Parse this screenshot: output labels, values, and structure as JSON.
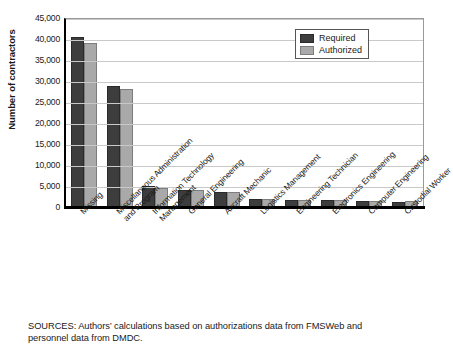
{
  "chart_data": {
    "type": "bar",
    "title": "",
    "xlabel": "",
    "ylabel": "Number of contractors",
    "ylim": [
      0,
      45000
    ],
    "ytick_labels": [
      "45,000",
      "40,000",
      "35,000",
      "30,000",
      "25,000",
      "20,000",
      "15,000",
      "10,000",
      "5,000",
      "0"
    ],
    "ytick_values": [
      45000,
      40000,
      35000,
      30000,
      25000,
      20000,
      15000,
      10000,
      5000,
      0
    ],
    "grid": true,
    "legend_position": "upper right",
    "categories": [
      "Missing",
      "Miscellaneous Administration and Program",
      "Information Technology Management",
      "General Engineering",
      "Aircraft Mechanic",
      "Logistics Management",
      "Engineering Technician",
      "Electronics Engineering",
      "Computer Engineering",
      "Custodial Worker"
    ],
    "category_lines": [
      [
        "Missing"
      ],
      [
        "Miscellaneous Administration",
        "and Program"
      ],
      [
        "Information Technology",
        "Management"
      ],
      [
        "General Engineering"
      ],
      [
        "Aircraft Mechanic"
      ],
      [
        "Logistics Management"
      ],
      [
        "Engineering Technician"
      ],
      [
        "Electronics Engineering"
      ],
      [
        "Computer Engineering"
      ],
      [
        "Custodial Worker"
      ]
    ],
    "series": [
      {
        "name": "Required",
        "color": "#3d3d3d",
        "values": [
          40400,
          28800,
          4900,
          4000,
          3600,
          1950,
          1600,
          1600,
          1350,
          1300
        ]
      },
      {
        "name": "Authorized",
        "color": "#a9a9a9",
        "values": [
          39100,
          28200,
          4600,
          4000,
          3600,
          2000,
          1650,
          1600,
          1350,
          1350
        ]
      }
    ]
  },
  "legend": {
    "items": [
      {
        "label": "Required",
        "swatch": "required-swatch"
      },
      {
        "label": "Authorized",
        "swatch": "authorized-swatch"
      }
    ]
  },
  "source_note": {
    "line1": "SOURCES: Authors’ calculations based on authorizations data from FMSWeb and",
    "line2": "personnel data from DMDC."
  }
}
